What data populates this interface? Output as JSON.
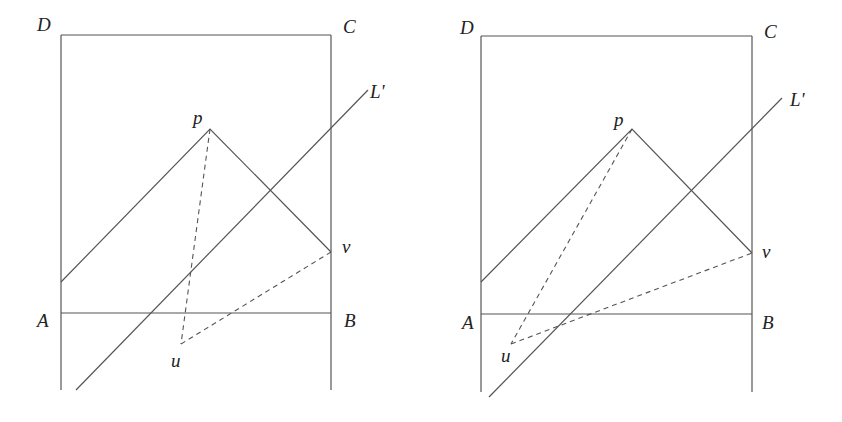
{
  "figure": {
    "panels": [
      {
        "id": "left",
        "labels": {
          "D": "D",
          "C": "C",
          "A": "A",
          "B": "B",
          "p": "p",
          "v": "v",
          "u": "u",
          "L": "L'"
        },
        "points": {
          "D": [
            61,
            35
          ],
          "C": [
            331,
            35
          ],
          "A": [
            61,
            313
          ],
          "B": [
            331,
            313
          ],
          "p": [
            210,
            129
          ],
          "v": [
            331,
            252
          ],
          "u": [
            181,
            344
          ],
          "left_diag_start": [
            61,
            282
          ],
          "L_top": [
            368,
            90
          ],
          "L_bottom": [
            76,
            390
          ]
        },
        "bottom_y": 390
      },
      {
        "id": "right",
        "labels": {
          "D": "D",
          "C": "C",
          "A": "A",
          "B": "B",
          "p": "p",
          "v": "v",
          "u": "u",
          "L": "L'"
        },
        "points": {
          "D": [
            481,
            36
          ],
          "C": [
            752,
            36
          ],
          "A": [
            481,
            314
          ],
          "B": [
            752,
            314
          ],
          "p": [
            632,
            129
          ],
          "v": [
            752,
            253
          ],
          "u": [
            511,
            344
          ],
          "left_diag_start": [
            481,
            282
          ],
          "L_top": [
            782,
            98
          ],
          "L_bottom": [
            489,
            397
          ]
        },
        "bottom_y": 392
      }
    ],
    "colors": {
      "line": "#555555",
      "text": "#222222",
      "background": "#ffffff"
    }
  }
}
